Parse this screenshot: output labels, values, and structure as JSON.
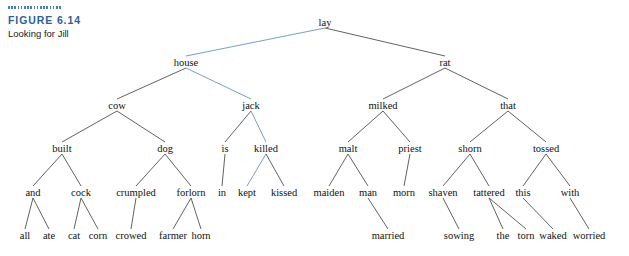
{
  "caption": {
    "figure_label": "FIGURE 6.14",
    "title": "Looking for Jill",
    "rule_color": "#4a7fb5",
    "label_color": "#2f5f96"
  },
  "colors": {
    "edge_default": "#3a3a3a",
    "edge_highlight": "#6a93c0",
    "text": "#111111",
    "background": "#ffffff"
  },
  "tree": {
    "type": "syntax-tree",
    "highlight_path": [
      "lay",
      "house",
      "jack",
      "killed",
      "kept"
    ],
    "nodes": [
      {
        "id": "lay",
        "label": "lay",
        "x": 325,
        "y": 22,
        "depth": 0
      },
      {
        "id": "house",
        "label": "house",
        "x": 186,
        "y": 62,
        "depth": 1
      },
      {
        "id": "rat",
        "label": "rat",
        "x": 445,
        "y": 62,
        "depth": 1
      },
      {
        "id": "cow",
        "label": "cow",
        "x": 117,
        "y": 105,
        "depth": 2
      },
      {
        "id": "jack",
        "label": "jack",
        "x": 251,
        "y": 105,
        "depth": 2
      },
      {
        "id": "milked",
        "label": "milked",
        "x": 383,
        "y": 105,
        "depth": 2
      },
      {
        "id": "that",
        "label": "that",
        "x": 508,
        "y": 105,
        "depth": 2
      },
      {
        "id": "built",
        "label": "built",
        "x": 62,
        "y": 148,
        "depth": 3
      },
      {
        "id": "dog",
        "label": "dog",
        "x": 165,
        "y": 148,
        "depth": 3
      },
      {
        "id": "is",
        "label": "is",
        "x": 225,
        "y": 148,
        "depth": 3
      },
      {
        "id": "killed",
        "label": "killed",
        "x": 266,
        "y": 148,
        "depth": 3
      },
      {
        "id": "malt",
        "label": "malt",
        "x": 348,
        "y": 148,
        "depth": 3
      },
      {
        "id": "priest",
        "label": "priest",
        "x": 410,
        "y": 148,
        "depth": 3
      },
      {
        "id": "shorn",
        "label": "shorn",
        "x": 470,
        "y": 148,
        "depth": 3
      },
      {
        "id": "tossed",
        "label": "tossed",
        "x": 546,
        "y": 148,
        "depth": 3
      },
      {
        "id": "and",
        "label": "and",
        "x": 33,
        "y": 192,
        "depth": 4
      },
      {
        "id": "cock",
        "label": "cock",
        "x": 81,
        "y": 192,
        "depth": 4
      },
      {
        "id": "crumpled",
        "label": "crumpled",
        "x": 136,
        "y": 192,
        "depth": 4
      },
      {
        "id": "forlorn",
        "label": "forlorn",
        "x": 191,
        "y": 192,
        "depth": 4
      },
      {
        "id": "in",
        "label": "in",
        "x": 222,
        "y": 192,
        "depth": 4
      },
      {
        "id": "kept",
        "label": "kept",
        "x": 247,
        "y": 192,
        "depth": 4
      },
      {
        "id": "kissed",
        "label": "kissed",
        "x": 284,
        "y": 192,
        "depth": 4
      },
      {
        "id": "maiden",
        "label": "maiden",
        "x": 329,
        "y": 192,
        "depth": 4
      },
      {
        "id": "man",
        "label": "man",
        "x": 368,
        "y": 192,
        "depth": 4
      },
      {
        "id": "morn",
        "label": "morn",
        "x": 404,
        "y": 192,
        "depth": 4
      },
      {
        "id": "shaven",
        "label": "shaven",
        "x": 443,
        "y": 192,
        "depth": 4
      },
      {
        "id": "tattered",
        "label": "tattered",
        "x": 489,
        "y": 192,
        "depth": 4
      },
      {
        "id": "this",
        "label": "this",
        "x": 523,
        "y": 192,
        "depth": 4
      },
      {
        "id": "with",
        "label": "with",
        "x": 570,
        "y": 192,
        "depth": 4
      },
      {
        "id": "all",
        "label": "all",
        "x": 25,
        "y": 235,
        "depth": 5
      },
      {
        "id": "ate",
        "label": "ate",
        "x": 49,
        "y": 235,
        "depth": 5
      },
      {
        "id": "cat",
        "label": "cat",
        "x": 74,
        "y": 235,
        "depth": 5
      },
      {
        "id": "corn",
        "label": "corn",
        "x": 98,
        "y": 235,
        "depth": 5
      },
      {
        "id": "crowed",
        "label": "crowed",
        "x": 131,
        "y": 235,
        "depth": 5
      },
      {
        "id": "farmer",
        "label": "farmer",
        "x": 173,
        "y": 235,
        "depth": 5
      },
      {
        "id": "horn",
        "label": "horn",
        "x": 201,
        "y": 235,
        "depth": 5
      },
      {
        "id": "married",
        "label": "married",
        "x": 388,
        "y": 235,
        "depth": 5
      },
      {
        "id": "sowing",
        "label": "sowing",
        "x": 459,
        "y": 235,
        "depth": 5
      },
      {
        "id": "the",
        "label": "the",
        "x": 503,
        "y": 235,
        "depth": 5
      },
      {
        "id": "torn",
        "label": "torn",
        "x": 526,
        "y": 235,
        "depth": 5
      },
      {
        "id": "waked",
        "label": "waked",
        "x": 553,
        "y": 235,
        "depth": 5
      },
      {
        "id": "worried",
        "label": "worried",
        "x": 589,
        "y": 235,
        "depth": 5
      }
    ],
    "edges": [
      {
        "from": "lay",
        "to": "house",
        "highlight": true
      },
      {
        "from": "lay",
        "to": "rat",
        "highlight": false
      },
      {
        "from": "house",
        "to": "cow",
        "highlight": false
      },
      {
        "from": "house",
        "to": "jack",
        "highlight": true
      },
      {
        "from": "rat",
        "to": "milked",
        "highlight": false
      },
      {
        "from": "rat",
        "to": "that",
        "highlight": false
      },
      {
        "from": "cow",
        "to": "built",
        "highlight": false
      },
      {
        "from": "cow",
        "to": "dog",
        "highlight": false
      },
      {
        "from": "jack",
        "to": "is",
        "highlight": false
      },
      {
        "from": "jack",
        "to": "killed",
        "highlight": true
      },
      {
        "from": "milked",
        "to": "malt",
        "highlight": false
      },
      {
        "from": "milked",
        "to": "priest",
        "highlight": false
      },
      {
        "from": "that",
        "to": "shorn",
        "highlight": false
      },
      {
        "from": "that",
        "to": "tossed",
        "highlight": false
      },
      {
        "from": "built",
        "to": "and",
        "highlight": false
      },
      {
        "from": "built",
        "to": "cock",
        "highlight": false
      },
      {
        "from": "dog",
        "to": "crumpled",
        "highlight": false
      },
      {
        "from": "dog",
        "to": "forlorn",
        "highlight": false
      },
      {
        "from": "is",
        "to": "in",
        "highlight": false
      },
      {
        "from": "killed",
        "to": "kept",
        "highlight": true
      },
      {
        "from": "killed",
        "to": "kissed",
        "highlight": false
      },
      {
        "from": "malt",
        "to": "maiden",
        "highlight": false
      },
      {
        "from": "malt",
        "to": "man",
        "highlight": false
      },
      {
        "from": "priest",
        "to": "morn",
        "highlight": false
      },
      {
        "from": "shorn",
        "to": "shaven",
        "highlight": false
      },
      {
        "from": "shorn",
        "to": "tattered",
        "highlight": false
      },
      {
        "from": "tossed",
        "to": "this",
        "highlight": false
      },
      {
        "from": "tossed",
        "to": "with",
        "highlight": false
      },
      {
        "from": "and",
        "to": "all",
        "highlight": false
      },
      {
        "from": "and",
        "to": "ate",
        "highlight": false
      },
      {
        "from": "cock",
        "to": "cat",
        "highlight": false
      },
      {
        "from": "cock",
        "to": "corn",
        "highlight": false
      },
      {
        "from": "crumpled",
        "to": "crowed",
        "highlight": false
      },
      {
        "from": "forlorn",
        "to": "farmer",
        "highlight": false
      },
      {
        "from": "forlorn",
        "to": "horn",
        "highlight": false
      },
      {
        "from": "man",
        "to": "married",
        "highlight": false
      },
      {
        "from": "shaven",
        "to": "sowing",
        "highlight": false
      },
      {
        "from": "tattered",
        "to": "the",
        "highlight": false
      },
      {
        "from": "tattered",
        "to": "torn",
        "highlight": false
      },
      {
        "from": "this",
        "to": "waked",
        "highlight": false
      },
      {
        "from": "with",
        "to": "worried",
        "highlight": false
      }
    ]
  }
}
